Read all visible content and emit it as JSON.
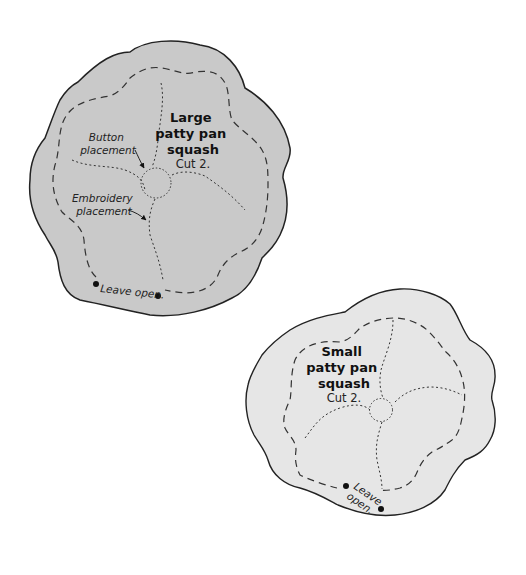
{
  "colors": {
    "large_fill": "#c9c9c9",
    "small_fill": "#e6e6e6",
    "outline": "#222222",
    "stitch": "#333333"
  },
  "large_piece": {
    "title_lines": [
      "Large",
      "patty pan",
      "squash"
    ],
    "cut_label": "Cut 2.",
    "button_label_lines": [
      "Button",
      "placement"
    ],
    "embroidery_label_lines": [
      "Embroidery",
      "placement"
    ],
    "leave_open_label": "Leave open."
  },
  "small_piece": {
    "title_lines": [
      "Small",
      "patty pan",
      "squash"
    ],
    "cut_label": "Cut 2.",
    "leave_open_lines": [
      "Leave",
      "open."
    ]
  }
}
